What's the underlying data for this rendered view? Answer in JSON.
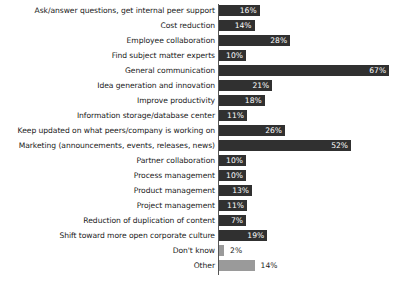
{
  "chart_data": {
    "type": "bar",
    "orientation": "horizontal",
    "title": "",
    "subtitle": "",
    "xlabel": "",
    "ylabel": "",
    "xlim": [
      0,
      70
    ],
    "grid": false,
    "legend": false,
    "value_suffix": "%",
    "categories": [
      "Ask/answer questions, get internal peer support",
      "Cost reduction",
      "Employee collaboration",
      "Find subject matter experts",
      "General communication",
      "Idea generation and innovation",
      "Improve productivity",
      "Information storage/database center",
      "Keep updated on what peers/company is working on",
      "Marketing (announcements, events, releases, news)",
      "Partner collaboration",
      "Process management",
      "Product management",
      "Project management",
      "Reduction of duplication of content",
      "Shift toward more open corporate culture",
      "Don't know",
      "Other"
    ],
    "values": [
      16,
      14,
      28,
      10,
      67,
      21,
      18,
      11,
      26,
      52,
      10,
      10,
      13,
      11,
      7,
      19,
      2,
      14
    ],
    "value_labels": [
      "16%",
      "14%",
      "28%",
      "10%",
      "67%",
      "21%",
      "18%",
      "11%",
      "26%",
      "52%",
      "10%",
      "10%",
      "13%",
      "11%",
      "7%",
      "19%",
      "2%",
      "14%"
    ],
    "series_colors": {
      "primary": "#303030",
      "secondary": "#9a9a9a"
    },
    "bar_styles": [
      "dark",
      "dark",
      "dark",
      "dark",
      "dark",
      "dark",
      "dark",
      "dark",
      "dark",
      "dark",
      "dark",
      "dark",
      "dark",
      "dark",
      "dark",
      "dark",
      "light",
      "light"
    ],
    "label_placement": [
      "inside",
      "inside",
      "inside",
      "inside",
      "inside",
      "inside",
      "inside",
      "inside",
      "inside",
      "inside",
      "inside",
      "inside",
      "inside",
      "inside",
      "inside",
      "inside",
      "outside",
      "outside"
    ]
  }
}
